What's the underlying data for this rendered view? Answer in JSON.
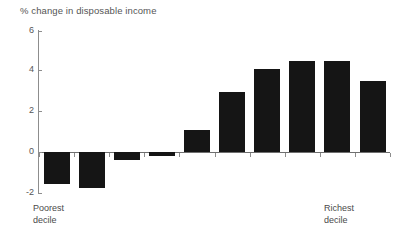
{
  "chart_data": {
    "type": "bar",
    "title": "% change in disposable income",
    "xlabel": "",
    "ylabel": "",
    "categories": [
      "1",
      "2",
      "3",
      "4",
      "5",
      "6",
      "7",
      "8",
      "9",
      "10"
    ],
    "values": [
      -1.6,
      -1.8,
      -0.4,
      -0.2,
      1.1,
      3.0,
      4.1,
      4.5,
      4.5,
      3.5
    ],
    "ylim": [
      -2,
      6
    ],
    "ytick_labels": [
      "6",
      "4",
      "2",
      "0",
      "-2"
    ],
    "ytick_values": [
      6,
      4,
      2,
      0,
      -2
    ],
    "grid": false,
    "legend": null,
    "series": [
      {
        "name": "% change in disposable income",
        "values": [
          -1.6,
          -1.8,
          -0.4,
          -0.2,
          1.1,
          3.0,
          4.1,
          4.5,
          4.5,
          3.5
        ]
      }
    ],
    "annotations": {
      "left_caption": "Poorest\ndecile",
      "right_caption": "Richest\ndecile"
    },
    "bar_color": "#151515",
    "axis_color": "#8d8d8d"
  },
  "axis": {
    "tick_6": "6",
    "tick_4": "4",
    "tick_2": "2",
    "tick_0": "0",
    "tick_m2": "-2"
  },
  "captions": {
    "poorest": "Poorest\ndecile",
    "richest": "Richest\ndecile"
  }
}
